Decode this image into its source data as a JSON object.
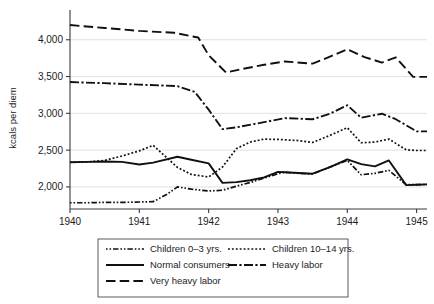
{
  "chart_data": {
    "type": "line",
    "title": "",
    "subtitle": "",
    "xlabel": "",
    "ylabel": "kcals per diem",
    "xlim": [
      1940.0,
      1945.15
    ],
    "ylim": [
      1700,
      4350
    ],
    "grid": true,
    "gridlines_y": [
      2000,
      2500,
      3000,
      3500,
      4000
    ],
    "xticks": [
      1940,
      1941,
      1942,
      1943,
      1944,
      1945
    ],
    "xticklabels": [
      "1940",
      "1941",
      "1942",
      "1943",
      "1944",
      "1945"
    ],
    "yticks": [
      2000,
      2500,
      3000,
      3500,
      4000
    ],
    "yticklabels": [
      "2,000",
      "2,500",
      "3,000",
      "3,500",
      "4,000"
    ],
    "legend_position": "below-center",
    "series": [
      {
        "name": "Children 0–3 yrs.",
        "dash": "dash-dot-dot",
        "x": [
          1940.0,
          1940.25,
          1940.5,
          1940.75,
          1941.0,
          1941.2,
          1941.4,
          1941.55,
          1941.75,
          1942.0,
          1942.2,
          1942.4,
          1942.6,
          1942.8,
          1943.0,
          1943.1,
          1943.3,
          1943.5,
          1943.75,
          1944.0,
          1944.2,
          1944.4,
          1944.6,
          1944.85,
          1945.0,
          1945.15
        ],
        "values": [
          1785,
          1785,
          1790,
          1790,
          1795,
          1800,
          1900,
          2000,
          1970,
          1945,
          1955,
          2010,
          2060,
          2120,
          2180,
          2200,
          2185,
          2175,
          2270,
          2360,
          2165,
          2185,
          2225,
          2030,
          2030,
          2035
        ]
      },
      {
        "name": "Children 10–14 yrs.",
        "dash": "dotted",
        "x": [
          1940.0,
          1940.25,
          1940.5,
          1940.75,
          1941.0,
          1941.2,
          1941.55,
          1941.75,
          1942.0,
          1942.2,
          1942.4,
          1942.6,
          1942.8,
          1943.0,
          1943.3,
          1943.5,
          1943.75,
          1944.0,
          1944.2,
          1944.4,
          1944.6,
          1944.85,
          1945.0,
          1945.15
        ],
        "values": [
          2335,
          2340,
          2360,
          2420,
          2490,
          2565,
          2265,
          2170,
          2135,
          2270,
          2520,
          2610,
          2650,
          2645,
          2630,
          2605,
          2700,
          2805,
          2600,
          2610,
          2650,
          2505,
          2495,
          2495
        ]
      },
      {
        "name": "Normal consumers",
        "dash": "solid",
        "x": [
          1940.0,
          1940.25,
          1940.5,
          1940.75,
          1941.0,
          1941.2,
          1941.55,
          1941.75,
          1942.0,
          1942.2,
          1942.4,
          1942.6,
          1942.8,
          1943.0,
          1943.1,
          1943.3,
          1943.5,
          1943.75,
          1944.0,
          1944.2,
          1944.4,
          1944.6,
          1944.85,
          1945.0,
          1945.15
        ],
        "values": [
          2335,
          2340,
          2345,
          2340,
          2305,
          2330,
          2410,
          2370,
          2320,
          2055,
          2065,
          2090,
          2130,
          2205,
          2200,
          2190,
          2180,
          2270,
          2375,
          2310,
          2280,
          2360,
          2025,
          2030,
          2035
        ]
      },
      {
        "name": "Heavy labor",
        "dash": "dash-dot",
        "x": [
          1940.0,
          1940.5,
          1941.0,
          1941.55,
          1941.8,
          1942.0,
          1942.2,
          1942.4,
          1942.8,
          1943.1,
          1943.5,
          1943.75,
          1944.0,
          1944.2,
          1944.5,
          1944.7,
          1945.0,
          1945.15
        ],
        "values": [
          3425,
          3410,
          3390,
          3370,
          3290,
          3050,
          2785,
          2810,
          2880,
          2935,
          2920,
          2995,
          3110,
          2940,
          2995,
          2920,
          2755,
          2755
        ]
      },
      {
        "name": "Very heavy labor",
        "dash": "long-dash",
        "x": [
          1940.0,
          1940.5,
          1941.0,
          1941.5,
          1941.85,
          1942.0,
          1942.25,
          1942.5,
          1942.8,
          1943.1,
          1943.5,
          1943.75,
          1944.0,
          1944.25,
          1944.5,
          1944.7,
          1944.95,
          1945.15
        ],
        "values": [
          4200,
          4160,
          4120,
          4095,
          4030,
          3790,
          3555,
          3605,
          3660,
          3705,
          3675,
          3770,
          3870,
          3765,
          3690,
          3760,
          3495,
          3495
        ]
      }
    ]
  },
  "legend": {
    "items": [
      {
        "label": "Children 0–3 yrs.",
        "style": "dash-dot-dot",
        "col": 0,
        "row": 0
      },
      {
        "label": "Children 10–14 yrs.",
        "style": "dotted",
        "col": 1,
        "row": 0
      },
      {
        "label": "Normal consumers",
        "style": "solid",
        "col": 0,
        "row": 1
      },
      {
        "label": "Heavy labor",
        "style": "dash-dot",
        "col": 1,
        "row": 1
      },
      {
        "label": "Very heavy labor",
        "style": "long-dash",
        "col": 0,
        "row": 2
      }
    ]
  },
  "colors": {
    "ink": "#101010",
    "grid": "#d9d9d9",
    "axis": "#3a3a3a",
    "background": "#ffffff"
  }
}
